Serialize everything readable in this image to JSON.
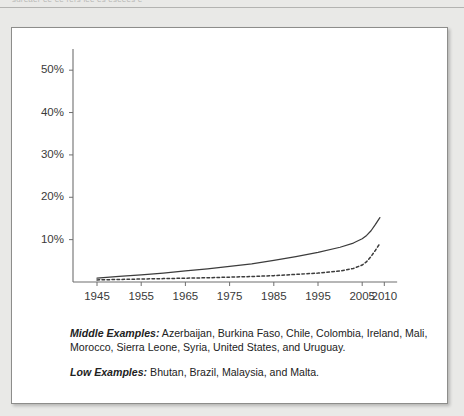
{
  "page": {
    "top_cutoff_text": "sdreaer ee  ee rers iee es eseees  e",
    "background_color": "#e9e9e7",
    "card_background": "#ffffff"
  },
  "chart_data": {
    "type": "line",
    "title": "",
    "subtitle": "",
    "xlabel": "",
    "ylabel": "",
    "grid": false,
    "legend_position": "none",
    "xlim": [
      1943,
      2012
    ],
    "ylim": [
      0,
      55
    ],
    "x_ticks": [
      1945,
      1955,
      1965,
      1975,
      1985,
      1995,
      2005,
      2010
    ],
    "x_tick_labels": [
      "1945",
      "1955",
      "1965",
      "1975",
      "1985",
      "1995",
      "2005",
      "2010"
    ],
    "y_ticks": [
      10,
      20,
      30,
      40,
      50
    ],
    "y_tick_labels": [
      "10%",
      "20%",
      "30%",
      "40%",
      "50%"
    ],
    "series": [
      {
        "name": "Middle",
        "style": "solid",
        "color": "#3c3c3c",
        "x": [
          1945,
          1950,
          1955,
          1960,
          1965,
          1970,
          1975,
          1980,
          1985,
          1990,
          1995,
          2000,
          2003,
          2005,
          2006,
          2007,
          2008,
          2009
        ],
        "values": [
          0.9,
          1.3,
          1.7,
          2.1,
          2.6,
          3.1,
          3.7,
          4.3,
          5.1,
          6.0,
          7.0,
          8.2,
          9.2,
          10.2,
          11.0,
          12.1,
          13.6,
          15.2
        ]
      },
      {
        "name": "Low",
        "style": "dashed",
        "color": "#3c3c3c",
        "x": [
          1945,
          1950,
          1955,
          1960,
          1965,
          1970,
          1975,
          1980,
          1985,
          1990,
          1995,
          2000,
          2003,
          2005,
          2006,
          2007,
          2008,
          2009
        ],
        "values": [
          0.5,
          0.6,
          0.7,
          0.8,
          0.9,
          1.0,
          1.15,
          1.3,
          1.5,
          1.8,
          2.1,
          2.6,
          3.2,
          4.0,
          4.8,
          6.0,
          7.5,
          9.1
        ]
      }
    ]
  },
  "captions": [
    {
      "lead": "Middle Examples:",
      "body": " Azerbaijan, Burkina Faso, Chile, Colombia, Ireland, Mali, Morocco, Sierra Leone, Syria, United States, and Uruguay."
    },
    {
      "lead": "Low Examples:",
      "body": " Bhutan, Brazil, Malaysia, and Malta."
    }
  ]
}
